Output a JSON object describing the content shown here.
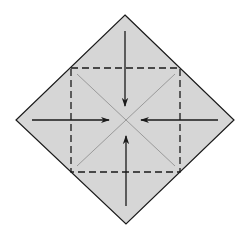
{
  "diagram": {
    "title": "",
    "colors": {
      "paper": "#d6d6d6",
      "edge": "#1a1a1a",
      "crease": "#8a8a8a",
      "fold_line": "#1a1a1a",
      "arrow": "#1a1a1a",
      "background": "#ffffff"
    },
    "elements": {
      "paper_shape": "square-rotated-45",
      "crease_lines": [
        "diagonal-top-left-to-bottom-right",
        "diagonal-top-right-to-bottom-left"
      ],
      "fold_guide": "dashed-square-valley-folds",
      "arrows": [
        {
          "name": "arrow-top-to-center",
          "direction": "down"
        },
        {
          "name": "arrow-left-to-center",
          "direction": "right"
        },
        {
          "name": "arrow-right-to-center",
          "direction": "left"
        },
        {
          "name": "arrow-bottom-to-center",
          "direction": "up"
        }
      ]
    }
  }
}
